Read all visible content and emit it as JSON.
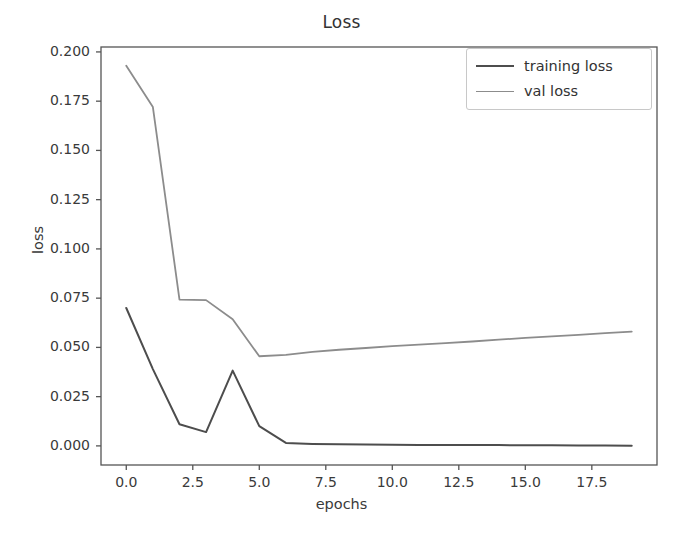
{
  "chart_data": {
    "type": "line",
    "title": "Loss",
    "xlabel": "epochs",
    "ylabel": "loss",
    "xlim": [
      -0.95,
      19.95
    ],
    "ylim": [
      -0.0097,
      0.2025
    ],
    "grid": false,
    "legend_position": "upper right",
    "x": [
      0,
      1,
      2,
      3,
      4,
      5,
      6,
      7,
      8,
      9,
      10,
      11,
      12,
      13,
      14,
      15,
      16,
      17,
      18,
      19
    ],
    "xticks": [
      "0.0",
      "2.5",
      "5.0",
      "7.5",
      "10.0",
      "12.5",
      "15.0",
      "17.5"
    ],
    "xtick_values": [
      0.0,
      2.5,
      5.0,
      7.5,
      10.0,
      12.5,
      15.0,
      17.5
    ],
    "yticks": [
      "0.000",
      "0.025",
      "0.050",
      "0.075",
      "0.100",
      "0.125",
      "0.150",
      "0.175",
      "0.200"
    ],
    "ytick_values": [
      0.0,
      0.025,
      0.05,
      0.075,
      0.1,
      0.125,
      0.15,
      0.175,
      0.2
    ],
    "series": [
      {
        "name": "training loss",
        "color": "#4d4d4d",
        "linewidth": 2.0,
        "values": [
          0.07,
          0.039,
          0.011,
          0.007,
          0.0382,
          0.01,
          0.0015,
          0.001,
          0.0008,
          0.0007,
          0.0006,
          0.0005,
          0.0005,
          0.0004,
          0.0004,
          0.0003,
          0.0003,
          0.0002,
          0.0002,
          0.0001
        ]
      },
      {
        "name": "val loss",
        "color": "#8c8c8c",
        "linewidth": 1.8,
        "values": [
          0.193,
          0.172,
          0.0743,
          0.074,
          0.0643,
          0.0455,
          0.0462,
          0.0477,
          0.0488,
          0.0497,
          0.0506,
          0.0514,
          0.0522,
          0.053,
          0.0539,
          0.0548,
          0.0556,
          0.0564,
          0.0572,
          0.058
        ]
      }
    ]
  },
  "legend": {
    "entries": [
      {
        "label": "training loss"
      },
      {
        "label": "val loss"
      }
    ]
  },
  "footer": {
    "caption": ""
  },
  "colors": {
    "training_loss": "#4d4d4d",
    "val_loss": "#8c8c8c",
    "axis": "#555555",
    "text": "#333333",
    "background": "#ffffff"
  }
}
